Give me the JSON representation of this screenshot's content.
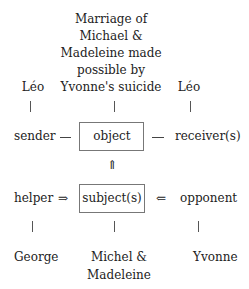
{
  "diagram": {
    "object_description": [
      "Marriage of",
      "Michael  &",
      "Madeleine made",
      "possible by",
      "Yvonne's suicide"
    ],
    "sender_value": "Léo",
    "receiver_value": "Léo",
    "sender_label": "sender",
    "object_label": "object",
    "receiver_label": "receiver(s)",
    "up_arrow": "⇑",
    "helper_label": "helper",
    "helper_arrow": "⇒",
    "subject_label": "subject(s)",
    "opponent_arrow": "⇐",
    "opponent_label": "opponent",
    "helper_value": "George",
    "subject_value": [
      "Michel &",
      "Madeleine"
    ],
    "opponent_value": "Yvonne"
  }
}
